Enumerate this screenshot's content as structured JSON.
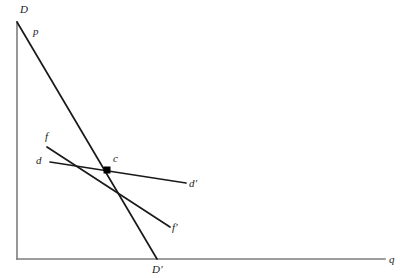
{
  "figure": {
    "background_color": "#ffffff",
    "axis_color": "#7d7d7d",
    "line_color": "#1a1a1a",
    "point_color": "#000000"
  },
  "axes": {
    "x_axis": {
      "label": "q",
      "name": "quantity-axis",
      "x1": 17,
      "y1": 259,
      "x2": 385,
      "y2": 259,
      "label_x": 389,
      "label_y": 254
    },
    "y_axis": {
      "label": "D",
      "name": "price-axis",
      "x1": 17,
      "y1": 22,
      "x2": 17,
      "y2": 259,
      "label_x": 20,
      "label_y": 4
    }
  },
  "curves": [
    {
      "id": "DD-prime",
      "name": "demand-curve-DDprime",
      "description": "steep demand curve from D to D-prime",
      "x1": 17,
      "y1": 22,
      "x2": 157,
      "y2": 259,
      "start_label": "D",
      "end_label": "D′",
      "mid_label": "p",
      "start_label_x": 20,
      "start_label_y": 4,
      "end_label_x": 152,
      "end_label_y": 264,
      "mid_label_x": 33,
      "mid_label_y": 26
    },
    {
      "id": "ff-prime",
      "name": "curve-ffprime",
      "description": "medium-slope line from f to f-prime",
      "x1": 47,
      "y1": 147,
      "x2": 170,
      "y2": 227,
      "start_label": "f",
      "end_label": "f′",
      "start_label_x": 45,
      "start_label_y": 131,
      "end_label_x": 172,
      "end_label_y": 222
    },
    {
      "id": "dd-prime",
      "name": "curve-ddprime",
      "description": "shallow-slope line from d to d-prime",
      "x1": 50,
      "y1": 162,
      "x2": 186,
      "y2": 183,
      "start_label": "d",
      "end_label": "d′",
      "start_label_x": 36,
      "start_label_y": 155,
      "end_label_x": 189,
      "end_label_y": 178
    }
  ],
  "points": [
    {
      "id": "c",
      "name": "equilibrium-point-c",
      "label": "c",
      "x": 107,
      "y": 170,
      "size": 7,
      "label_x": 113,
      "label_y": 153
    }
  ]
}
